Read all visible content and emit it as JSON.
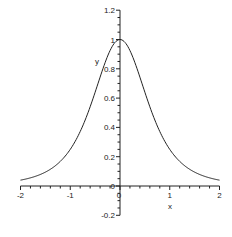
{
  "chart_data": {
    "type": "line",
    "title": "",
    "xlabel": "x",
    "ylabel": "y",
    "xlim": [
      -2,
      2
    ],
    "ylim": [
      -0.2,
      1.2
    ],
    "grid": false,
    "legend": null,
    "x_ticks": [
      -2,
      -1,
      0,
      1,
      2
    ],
    "x_tick_labels": [
      "-2",
      "-1",
      "0",
      "1",
      "2"
    ],
    "y_ticks": [
      -0.2,
      0,
      0.2,
      0.4,
      0.6,
      0.8,
      1,
      1.2
    ],
    "y_tick_labels": [
      "-0.2",
      "0",
      "0.2",
      "0.4",
      "0.6",
      "0.8",
      "1",
      "1.2"
    ],
    "function": "1/(1+x^2)^2",
    "series": [
      {
        "name": "y",
        "x": [
          -2,
          -1.75,
          -1.5,
          -1.25,
          -1,
          -0.75,
          -0.5,
          -0.25,
          0,
          0.25,
          0.5,
          0.75,
          1,
          1.25,
          1.5,
          1.75,
          2
        ],
        "values": [
          0.04,
          0.059,
          0.095,
          0.152,
          0.25,
          0.41,
          0.64,
          0.886,
          1.0,
          0.886,
          0.64,
          0.41,
          0.25,
          0.152,
          0.095,
          0.059,
          0.04
        ]
      }
    ],
    "color": "#222222"
  }
}
